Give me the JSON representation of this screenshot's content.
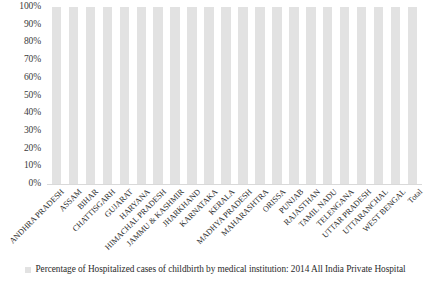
{
  "chart_data": {
    "type": "bar",
    "title": "",
    "subtitle": "",
    "xlabel": "",
    "ylabel": "",
    "ylim": [
      0,
      100
    ],
    "grid": false,
    "legend_position": "bottom",
    "y_ticks": [
      "100%",
      "90%",
      "80%",
      "70%",
      "60%",
      "50%",
      "40%",
      "30%",
      "20%",
      "10%",
      "0%"
    ],
    "legend": [
      {
        "label": "Percentage of Hospitalized cases of childbirth by medical institution: 2014 All India Private Hospital",
        "color": "#e2e2e2"
      }
    ],
    "categories": [
      "ANDHRA PRADESH",
      "ASSAM",
      "BIHAR",
      "CHATTISGARH",
      "GUJARAT",
      "HARYANA",
      "HIMACHAL PRADESH",
      "JAMMU & KASHMIR",
      "JHARKHAND",
      "KARNATAKA",
      "KERALA",
      "MADHYA PRADESH",
      "MAHARASHTRA",
      "ORISSA",
      "PUNJAB",
      "RAJASTHAN",
      "TAMIL NADU",
      "TELENGANA",
      "UTTAR PRADESH",
      "UTTARANCHAL",
      "WEST BENGAL",
      "Total"
    ],
    "series": [
      {
        "name": "Percentage of Hospitalized cases of childbirth by medical institution: 2014 All India Private Hospital",
        "color": "#e2e2e2",
        "values": [
          100,
          100,
          100,
          100,
          100,
          100,
          100,
          100,
          100,
          100,
          100,
          100,
          100,
          100,
          100,
          100,
          100,
          100,
          100,
          100,
          100,
          100
        ]
      }
    ]
  }
}
